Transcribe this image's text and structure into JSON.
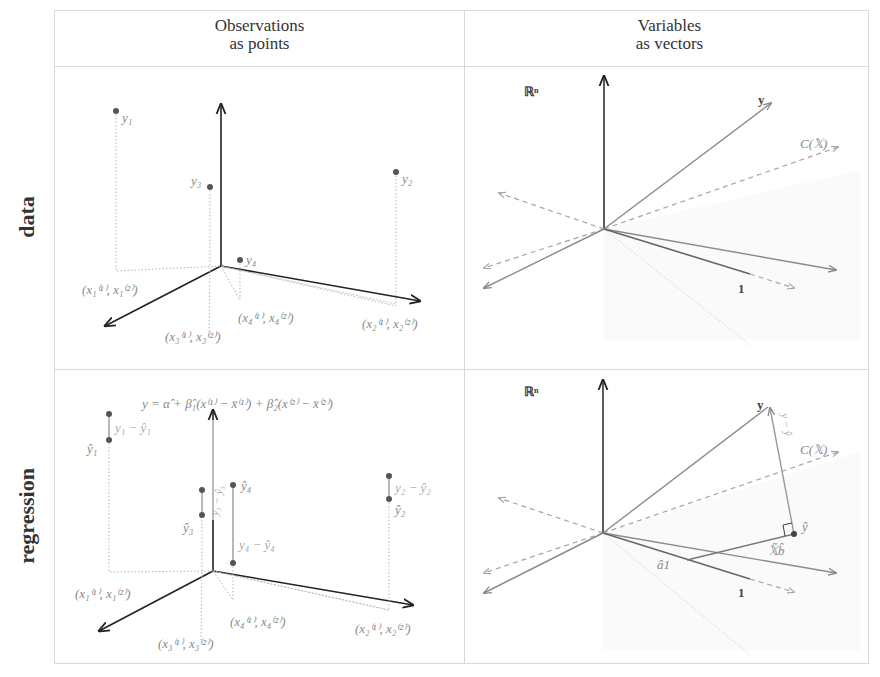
{
  "columns": [
    {
      "line1": "Observations",
      "line2": "as points"
    },
    {
      "line1": "Variables",
      "line2": "as vectors"
    }
  ],
  "rows": [
    {
      "label": "data"
    },
    {
      "label": "regression"
    }
  ],
  "panels": {
    "data_points": {
      "points": [
        {
          "label": "y₁"
        },
        {
          "label": "y₂"
        },
        {
          "label": "y₃"
        },
        {
          "label": "y₄"
        }
      ],
      "coords": [
        "(x₁⁽¹⁾, x₁⁽²⁾)",
        "(x₂⁽¹⁾, x₂⁽²⁾)",
        "(x₃⁽¹⁾, x₃⁽²⁾)",
        "(x₄⁽¹⁾, x₄⁽²⁾)"
      ]
    },
    "data_vectors": {
      "space_label": "ℝⁿ",
      "y_label": "y",
      "colspace_label": "C(𝕏)",
      "one_label": "1"
    },
    "regression_points": {
      "equation": "y = α̂ + β̂₁(x⁽¹⁾ − x̄⁽¹⁾) + β̂₂(x⁽²⁾ − x̄⁽²⁾)",
      "fitted": [
        "ŷ₁",
        "ŷ₂",
        "ŷ₃",
        "ŷ₄"
      ],
      "residuals": [
        "y₁ − ŷ₁",
        "y₂ − ŷ₂",
        "y₃ − ŷ₃",
        "y₄ − ŷ₄"
      ],
      "coords": [
        "(x₁⁽¹⁾, x₁⁽²⁾)",
        "(x₂⁽¹⁾, x₂⁽²⁾)",
        "(x₃⁽¹⁾, x₃⁽²⁾)",
        "(x₄⁽¹⁾, x₄⁽²⁾)"
      ]
    },
    "regression_vectors": {
      "space_label": "ℝⁿ",
      "y_label": "y",
      "yhat_label": "ŷ",
      "residual_label": "y − ŷ",
      "colspace_label": "C(𝕏)",
      "one_label": "1",
      "a1_label": "â1",
      "xb_label": "𝕏̃b̂"
    }
  },
  "colors": {
    "axis": "#222222",
    "vector": "#8a8a8a",
    "dashed": "#a5a5a5",
    "dotted": "#b5b5b5",
    "point": "#555555",
    "grid_border": "#d9d9d9"
  }
}
